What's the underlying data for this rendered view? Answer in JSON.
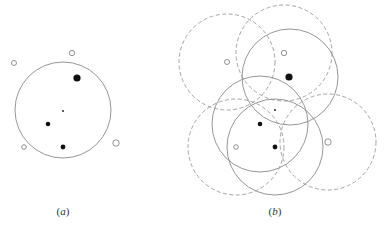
{
  "colors": {
    "line": "#8a8a8a",
    "dashed_line": "#9a9a9a",
    "filled_point": "#111111",
    "open_point_stroke": "#777777",
    "background": "#ffffff"
  },
  "panels": [
    {
      "id": "a",
      "label": "(a)",
      "label_x": 63,
      "circles": [
        {
          "cx": 63,
          "cy": 110,
          "r": 48,
          "style": "solid"
        }
      ],
      "points": [
        {
          "x": 72,
          "y": 53,
          "r": 2.7,
          "type": "open"
        },
        {
          "x": 14,
          "y": 63,
          "r": 2.5,
          "type": "open"
        },
        {
          "x": 77,
          "y": 78,
          "r": 3.6,
          "type": "filled"
        },
        {
          "x": 63,
          "y": 111,
          "r": 0.9,
          "type": "filled"
        },
        {
          "x": 48,
          "y": 124,
          "r": 2.3,
          "type": "filled"
        },
        {
          "x": 63,
          "y": 147,
          "r": 2.4,
          "type": "filled"
        },
        {
          "x": 24,
          "y": 147,
          "r": 2.3,
          "type": "open"
        },
        {
          "x": 116,
          "y": 143,
          "r": 3.2,
          "type": "open"
        }
      ]
    },
    {
      "id": "b",
      "label": "(b)",
      "label_x": 275,
      "circles": [
        {
          "cx": 227,
          "cy": 62,
          "r": 48,
          "style": "dashed"
        },
        {
          "cx": 284,
          "cy": 53,
          "r": 48,
          "style": "dashed"
        },
        {
          "cx": 236,
          "cy": 147,
          "r": 48,
          "style": "dashed"
        },
        {
          "cx": 328,
          "cy": 142,
          "r": 48,
          "style": "dashed"
        },
        {
          "cx": 290,
          "cy": 77,
          "r": 48,
          "style": "solid"
        },
        {
          "cx": 260,
          "cy": 124,
          "r": 48,
          "style": "solid"
        },
        {
          "cx": 275,
          "cy": 147,
          "r": 48,
          "style": "solid"
        }
      ],
      "points": [
        {
          "x": 227,
          "y": 62,
          "r": 2.5,
          "type": "open"
        },
        {
          "x": 284,
          "y": 53,
          "r": 2.7,
          "type": "open"
        },
        {
          "x": 289,
          "y": 77,
          "r": 3.6,
          "type": "filled"
        },
        {
          "x": 275,
          "y": 110,
          "r": 0.9,
          "type": "filled"
        },
        {
          "x": 260,
          "y": 124,
          "r": 2.3,
          "type": "filled"
        },
        {
          "x": 275,
          "y": 147,
          "r": 2.4,
          "type": "filled"
        },
        {
          "x": 236,
          "y": 147,
          "r": 2.3,
          "type": "open"
        },
        {
          "x": 328,
          "y": 142,
          "r": 3.2,
          "type": "open"
        }
      ]
    }
  ]
}
